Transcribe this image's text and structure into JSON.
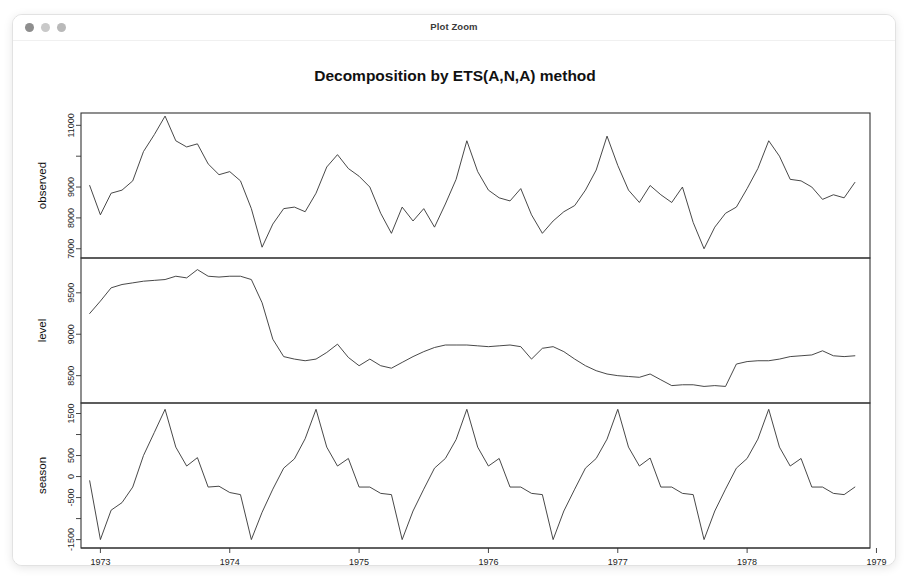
{
  "window": {
    "title": "Plot Zoom",
    "controls": [
      {
        "name": "close",
        "color": "#8e8e8e"
      },
      {
        "name": "minimize",
        "color": "#c9c9c9"
      },
      {
        "name": "maximize",
        "color": "#b9b9b9"
      }
    ]
  },
  "chart_data": {
    "type": "line",
    "title": "Decomposition by ETS(A,N,A) method",
    "xlabel": "Time",
    "ylabel": "",
    "grid": false,
    "legend": "none",
    "xlim": [
      1972.85,
      1978.95
    ],
    "x_ticks": [
      1973,
      1974,
      1975,
      1976,
      1977,
      1978,
      1979
    ],
    "x_tick_labels": [
      "1973",
      "1974",
      "1975",
      "1976",
      "1977",
      "1978",
      "1979"
    ],
    "x": [
      1972.917,
      1973.0,
      1973.083,
      1973.167,
      1973.25,
      1973.333,
      1973.417,
      1973.5,
      1973.583,
      1973.667,
      1973.75,
      1973.833,
      1973.917,
      1974.0,
      1974.083,
      1974.167,
      1974.25,
      1974.333,
      1974.417,
      1974.5,
      1974.583,
      1974.667,
      1974.75,
      1974.833,
      1974.917,
      1975.0,
      1975.083,
      1975.167,
      1975.25,
      1975.333,
      1975.417,
      1975.5,
      1975.583,
      1975.667,
      1975.75,
      1975.833,
      1975.917,
      1976.0,
      1976.083,
      1976.167,
      1976.25,
      1976.333,
      1976.417,
      1976.5,
      1976.583,
      1976.667,
      1976.75,
      1976.833,
      1976.917,
      1977.0,
      1977.083,
      1977.167,
      1977.25,
      1977.333,
      1977.417,
      1977.5,
      1977.583,
      1977.667,
      1977.75,
      1977.833,
      1977.917,
      1978.0,
      1978.083,
      1978.167,
      1978.25,
      1978.333,
      1978.417,
      1978.5,
      1978.583,
      1978.667,
      1978.75,
      1978.833
    ],
    "panels": [
      {
        "name": "observed",
        "label": "observed",
        "ylim": [
          6700,
          11400
        ],
        "y_ticks": [
          7000,
          8000,
          9000,
          10000,
          11000
        ],
        "y_tick_labels": [
          "7000",
          "8000",
          "9000",
          "",
          "11000"
        ],
        "values": [
          9050,
          8100,
          8800,
          8900,
          9200,
          10150,
          10700,
          11300,
          10500,
          10300,
          10400,
          9750,
          9400,
          9500,
          9200,
          8300,
          7050,
          7800,
          8300,
          8350,
          8200,
          8800,
          9650,
          10050,
          9600,
          9350,
          9000,
          8150,
          7500,
          8350,
          7900,
          8300,
          7700,
          8450,
          9250,
          10500,
          9500,
          8900,
          8650,
          8550,
          8950,
          8100,
          7500,
          7900,
          8200,
          8400,
          8900,
          9550,
          10650,
          9700,
          8900,
          8500,
          9050,
          8750,
          8500,
          9000,
          7850,
          7000,
          7700,
          8150,
          8350,
          8950,
          9600,
          10500,
          10000,
          9250,
          9200,
          9000,
          8600,
          8750,
          8650,
          9150
        ]
      },
      {
        "name": "level",
        "label": "level",
        "ylim": [
          8170,
          9920
        ],
        "y_ticks": [
          8500,
          9000,
          9500
        ],
        "y_tick_labels": [
          "8500",
          "9000",
          "9500"
        ],
        "values": [
          9250,
          9400,
          9560,
          9600,
          9620,
          9640,
          9650,
          9660,
          9700,
          9680,
          9780,
          9700,
          9690,
          9700,
          9700,
          9660,
          9380,
          8940,
          8730,
          8700,
          8680,
          8700,
          8780,
          8880,
          8720,
          8620,
          8700,
          8620,
          8590,
          8660,
          8730,
          8790,
          8840,
          8870,
          8870,
          8870,
          8860,
          8850,
          8860,
          8870,
          8850,
          8700,
          8830,
          8850,
          8790,
          8700,
          8620,
          8560,
          8520,
          8500,
          8490,
          8480,
          8520,
          8450,
          8380,
          8390,
          8390,
          8370,
          8380,
          8370,
          8640,
          8670,
          8680,
          8680,
          8700,
          8730,
          8740,
          8750,
          8800,
          8740,
          8730,
          8740
        ]
      },
      {
        "name": "season",
        "label": "season",
        "ylim": [
          -1700,
          1750
        ],
        "y_ticks": [
          1500,
          1000,
          500,
          0,
          -500,
          -1000,
          -1500
        ],
        "y_tick_labels": [
          "1500",
          "",
          "500",
          "0",
          "-500",
          "",
          "-1500"
        ],
        "values": [
          -100,
          -1500,
          -800,
          -620,
          -250,
          500,
          1050,
          1600,
          700,
          250,
          450,
          -250,
          -230,
          -380,
          -430,
          -1500,
          -850,
          -300,
          200,
          420,
          900,
          1600,
          700,
          250,
          430,
          -250,
          -250,
          -400,
          -430,
          -1500,
          -820,
          -300,
          200,
          430,
          880,
          1600,
          700,
          250,
          430,
          -250,
          -250,
          -400,
          -430,
          -1500,
          -820,
          -300,
          200,
          430,
          890,
          1600,
          700,
          250,
          440,
          -250,
          -250,
          -400,
          -430,
          -1500,
          -820,
          -300,
          200,
          430,
          890,
          1600,
          700,
          250,
          430,
          -250,
          -250,
          -400,
          -430,
          -250
        ]
      }
    ]
  }
}
